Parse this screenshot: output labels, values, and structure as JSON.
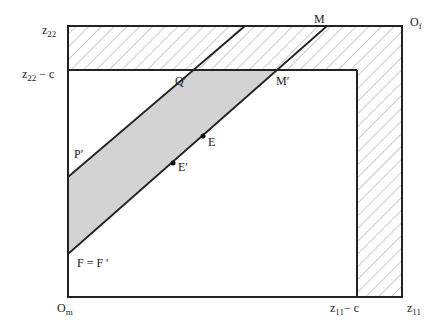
{
  "diagram": {
    "type": "edgeworth-box",
    "colors": {
      "line": "#222222",
      "shade": "#d3d3d3",
      "hatch": "#9a9a9a"
    },
    "labels": {
      "z22": "z",
      "z22_sub": "22",
      "z22c": "z",
      "z22c_sub": "22",
      "z22c_suffix": " − c",
      "Of": "O",
      "Of_sub": "f",
      "Om": "O",
      "Om_sub": "m",
      "z11c": "z",
      "z11c_sub": "11",
      "z11c_suffix": "− c",
      "z11": "z",
      "z11_sub": "11",
      "M": "M",
      "Mprime": "M′",
      "Qprime": "Q′",
      "Pprime": "P′",
      "E": "E",
      "Eprime": "E′",
      "F": "F = F ′"
    }
  }
}
